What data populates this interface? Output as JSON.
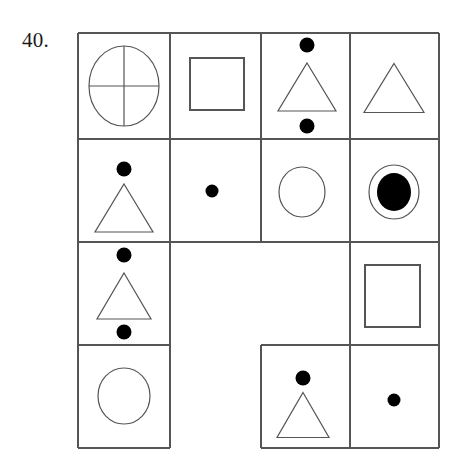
{
  "problem": {
    "number_label": "40.",
    "type": "figure-matrix-visual-analogy"
  },
  "canvas": {
    "width": 462,
    "height": 464,
    "background": "#ffffff"
  },
  "style": {
    "line_color": "#555555",
    "fill_color": "#000000",
    "stroke_width": 1.2
  },
  "grid": {
    "left": 78,
    "top": 33,
    "right": 439,
    "bottom": 448,
    "column_x": [
      78,
      170,
      261,
      350,
      439
    ],
    "row_y": [
      33,
      139,
      242,
      345,
      448
    ],
    "rows": 4,
    "columns": 4
  },
  "cells": [
    {
      "id": "r1c1",
      "row": 1,
      "col": 1,
      "bordered": true,
      "name": "cell-circle-with-cross",
      "contents": [
        {
          "shape": "circle-quartered",
          "cx": 124,
          "cy": 86,
          "rx": 35,
          "ry": 40,
          "fill": "none"
        }
      ]
    },
    {
      "id": "r1c2",
      "row": 1,
      "col": 2,
      "bordered": true,
      "name": "cell-square",
      "contents": [
        {
          "shape": "square",
          "x": 190,
          "y": 58,
          "w": 54,
          "h": 52,
          "fill": "none"
        }
      ]
    },
    {
      "id": "r1c3",
      "row": 1,
      "col": 3,
      "bordered": true,
      "name": "cell-dot-triangle-dot",
      "contents": [
        {
          "shape": "dot",
          "cx": 307,
          "cy": 45,
          "r": 7.5,
          "fill": "solid"
        },
        {
          "shape": "triangle",
          "cx": 307,
          "cy": 87,
          "w": 58,
          "h": 48,
          "fill": "none"
        },
        {
          "shape": "dot",
          "cx": 307,
          "cy": 126,
          "r": 7.5,
          "fill": "solid"
        }
      ]
    },
    {
      "id": "r1c4",
      "row": 1,
      "col": 4,
      "bordered": true,
      "name": "cell-triangle",
      "contents": [
        {
          "shape": "triangle",
          "cx": 394,
          "cy": 88,
          "w": 60,
          "h": 49,
          "fill": "none"
        }
      ]
    },
    {
      "id": "r2c1",
      "row": 2,
      "col": 1,
      "bordered": true,
      "name": "cell-dot-triangle",
      "contents": [
        {
          "shape": "dot",
          "cx": 124,
          "cy": 169,
          "r": 7.5,
          "fill": "solid"
        },
        {
          "shape": "triangle",
          "cx": 124,
          "cy": 208,
          "w": 58,
          "h": 48,
          "fill": "none"
        }
      ]
    },
    {
      "id": "r2c2",
      "row": 2,
      "col": 2,
      "bordered": true,
      "name": "cell-single-dot",
      "contents": [
        {
          "shape": "dot",
          "cx": 212,
          "cy": 191,
          "r": 6.5,
          "fill": "solid"
        }
      ]
    },
    {
      "id": "r2c3",
      "row": 2,
      "col": 3,
      "bordered": true,
      "name": "cell-open-circle",
      "contents": [
        {
          "shape": "circle",
          "cx": 302,
          "cy": 192,
          "rx": 23,
          "ry": 25,
          "fill": "none"
        }
      ]
    },
    {
      "id": "r2c4",
      "row": 2,
      "col": 4,
      "bordered": true,
      "name": "cell-filled-circle-in-circle",
      "contents": [
        {
          "shape": "circle",
          "cx": 394,
          "cy": 192,
          "rx": 25,
          "ry": 27,
          "fill": "none"
        },
        {
          "shape": "circle",
          "cx": 394,
          "cy": 192,
          "rx": 17,
          "ry": 19,
          "fill": "solid"
        }
      ]
    },
    {
      "id": "r3c1",
      "row": 3,
      "col": 1,
      "bordered": true,
      "name": "cell-dot-triangle-dot-2",
      "contents": [
        {
          "shape": "dot",
          "cx": 124,
          "cy": 255,
          "r": 7.5,
          "fill": "solid"
        },
        {
          "shape": "triangle",
          "cx": 124,
          "cy": 296,
          "w": 54,
          "h": 46,
          "fill": "none"
        },
        {
          "shape": "dot",
          "cx": 124,
          "cy": 332,
          "r": 7.5,
          "fill": "solid"
        }
      ]
    },
    {
      "id": "r3c23",
      "row": 3,
      "col": 2,
      "colspan": 2,
      "bordered": false,
      "name": "cell-empty-merged",
      "contents": []
    },
    {
      "id": "r3c4",
      "row": 3,
      "col": 4,
      "bordered": true,
      "name": "cell-square-2",
      "contents": [
        {
          "shape": "square",
          "x": 365,
          "y": 265,
          "w": 55,
          "h": 62,
          "fill": "none"
        }
      ]
    },
    {
      "id": "r4c1",
      "row": 4,
      "col": 1,
      "bordered": true,
      "name": "cell-open-circle-2",
      "contents": [
        {
          "shape": "circle",
          "cx": 124,
          "cy": 396,
          "rx": 26,
          "ry": 28,
          "fill": "none"
        }
      ]
    },
    {
      "id": "r4c2",
      "row": 4,
      "col": 2,
      "bordered": false,
      "name": "cell-blank-1",
      "contents": []
    },
    {
      "id": "r4c3",
      "row": 4,
      "col": 3,
      "bordered": true,
      "name": "cell-dot-triangle-2",
      "contents": [
        {
          "shape": "dot",
          "cx": 303,
          "cy": 378,
          "r": 7.5,
          "fill": "solid"
        },
        {
          "shape": "triangle",
          "cx": 303,
          "cy": 415,
          "w": 52,
          "h": 45,
          "fill": "none"
        }
      ]
    },
    {
      "id": "r4c4",
      "row": 4,
      "col": 4,
      "bordered": true,
      "name": "cell-single-dot-2",
      "contents": [
        {
          "shape": "dot",
          "cx": 394,
          "cy": 400,
          "r": 6.5,
          "fill": "solid"
        }
      ]
    }
  ],
  "border_segments": {
    "horizontal": [
      {
        "name": "top-border",
        "y": 33,
        "x1": 78,
        "x2": 439
      },
      {
        "name": "row1-row2-divider",
        "y": 139,
        "x1": 78,
        "x2": 439
      },
      {
        "name": "row2-row3-divider",
        "y": 242,
        "x1": 78,
        "x2": 439
      },
      {
        "name": "row3-row4-divider-left",
        "y": 345,
        "x1": 78,
        "x2": 170
      },
      {
        "name": "row3-row4-divider-right",
        "y": 345,
        "x1": 261,
        "x2": 439
      },
      {
        "name": "bottom-border-left",
        "y": 448,
        "x1": 78,
        "x2": 170
      },
      {
        "name": "bottom-border-right",
        "y": 448,
        "x1": 261,
        "x2": 439
      }
    ],
    "vertical": [
      {
        "name": "left-border",
        "x": 78,
        "y1": 33,
        "y2": 448
      },
      {
        "name": "col1-col2-divider",
        "x": 170,
        "y1": 33,
        "y2": 448
      },
      {
        "name": "col2-col3-divider-top",
        "x": 261,
        "y1": 33,
        "y2": 242
      },
      {
        "name": "col2-col3-divider-bottom",
        "x": 261,
        "y1": 345,
        "y2": 448
      },
      {
        "name": "col3-col4-divider-top",
        "x": 350,
        "y1": 33,
        "y2": 345
      },
      {
        "name": "col3-col4-divider-bottom",
        "x": 350,
        "y1": 345,
        "y2": 448
      },
      {
        "name": "right-border",
        "x": 439,
        "y1": 33,
        "y2": 448
      }
    ]
  }
}
